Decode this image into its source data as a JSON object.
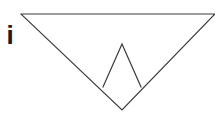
{
  "figure": {
    "label": "i",
    "background_color": "#ffffff",
    "stroke_color": "#3a3a3a",
    "label_color": "#1a1a1a",
    "stroke_width": 1.2,
    "canvas": {
      "width": 215,
      "height": 113
    },
    "shapes": [
      {
        "name": "outer-inverted-triangle",
        "type": "polyline",
        "closed": false,
        "points": "21,14 215,14 122,110 21,14",
        "description": "Large downward-pointing triangle, right vertex clipped at canvas edge"
      },
      {
        "name": "inner-upright-triangle",
        "type": "polyline",
        "closed": false,
        "points": "103,87 122,44 141,87",
        "description": "Small upward-pointing triangle nested inside, apex up, open base"
      }
    ],
    "vertices": [
      {
        "name": "outer-top-left",
        "x": 21,
        "y": 14
      },
      {
        "name": "outer-top-right",
        "x": 215,
        "y": 14
      },
      {
        "name": "outer-bottom-apex",
        "x": 122,
        "y": 110
      },
      {
        "name": "inner-apex",
        "x": 122,
        "y": 44
      },
      {
        "name": "inner-base-left",
        "x": 103,
        "y": 87
      },
      {
        "name": "inner-base-right",
        "x": 141,
        "y": 87
      }
    ]
  }
}
